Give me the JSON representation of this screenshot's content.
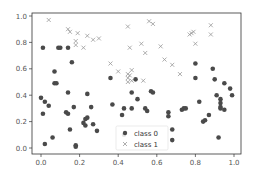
{
  "chart_data": {
    "type": "scatter",
    "title": "",
    "xlabel": "",
    "ylabel": "",
    "xlim": [
      -0.05,
      1.04
    ],
    "ylim": [
      -0.05,
      1.03
    ],
    "grid": false,
    "legend_position": "lower center",
    "x_ticks": [
      "0.0",
      "0.2",
      "0.4",
      "0.6",
      "0.8",
      "1.0"
    ],
    "y_ticks": [
      "0.0",
      "0.2",
      "0.4",
      "0.6",
      "0.8",
      "1.0"
    ],
    "series": [
      {
        "name": "class 0",
        "marker": "circle",
        "color": "#4a4a4a",
        "points": [
          [
            0.01,
            0.76
          ],
          [
            0.09,
            0.76
          ],
          [
            0.1,
            0.76
          ],
          [
            0.14,
            0.76
          ],
          [
            0.16,
            0.65
          ],
          [
            0.07,
            0.58
          ],
          [
            0.07,
            0.49
          ],
          [
            0.08,
            0.49
          ],
          [
            0.14,
            0.42
          ],
          [
            0.24,
            0.41
          ],
          [
            0.0,
            0.38
          ],
          [
            0.02,
            0.35
          ],
          [
            0.04,
            0.32
          ],
          [
            0.01,
            0.26
          ],
          [
            0.13,
            0.27
          ],
          [
            0.14,
            0.26
          ],
          [
            0.17,
            0.31
          ],
          [
            0.26,
            0.31
          ],
          [
            0.37,
            0.33
          ],
          [
            0.43,
            0.3
          ],
          [
            0.23,
            0.22
          ],
          [
            0.24,
            0.23
          ],
          [
            0.22,
            0.19
          ],
          [
            0.23,
            0.17
          ],
          [
            0.27,
            0.18
          ],
          [
            0.15,
            0.14
          ],
          [
            0.29,
            0.13
          ],
          [
            0.06,
            0.08
          ],
          [
            0.02,
            0.03
          ],
          [
            0.18,
            0.02
          ],
          [
            0.18,
            0.01
          ],
          [
            0.43,
            0.1
          ],
          [
            0.49,
            0.52
          ],
          [
            0.36,
            0.53
          ],
          [
            0.47,
            0.42
          ],
          [
            0.5,
            0.37
          ],
          [
            0.57,
            0.43
          ],
          [
            0.58,
            0.42
          ],
          [
            0.54,
            0.3
          ],
          [
            0.55,
            0.28
          ],
          [
            0.47,
            0.3
          ],
          [
            0.42,
            0.25
          ],
          [
            0.66,
            0.27
          ],
          [
            0.66,
            0.24
          ],
          [
            0.73,
            0.29
          ],
          [
            0.74,
            0.3
          ],
          [
            0.75,
            0.3
          ],
          [
            0.68,
            0.14
          ],
          [
            0.68,
            0.06
          ],
          [
            0.8,
            0.53
          ],
          [
            0.82,
            0.35
          ],
          [
            0.84,
            0.2
          ],
          [
            0.85,
            0.21
          ],
          [
            0.89,
            0.6
          ],
          [
            0.9,
            0.52
          ],
          [
            0.91,
            0.4
          ],
          [
            0.93,
            0.37
          ],
          [
            0.93,
            0.34
          ],
          [
            0.93,
            0.31
          ],
          [
            0.95,
            0.29
          ],
          [
            0.95,
            0.49
          ],
          [
            0.98,
            0.45
          ],
          [
            0.99,
            0.4
          ],
          [
            0.92,
            0.08
          ],
          [
            0.87,
            0.25
          ],
          [
            0.93,
            0.3
          ],
          [
            0.8,
            0.64
          ]
        ]
      },
      {
        "name": "class 1",
        "marker": "x",
        "color": "#999999",
        "points": [
          [
            0.04,
            0.97
          ],
          [
            0.14,
            0.9
          ],
          [
            0.15,
            0.88
          ],
          [
            0.19,
            0.87
          ],
          [
            0.24,
            0.85
          ],
          [
            0.18,
            0.81
          ],
          [
            0.18,
            0.78
          ],
          [
            0.22,
            0.76
          ],
          [
            0.27,
            0.82
          ],
          [
            0.3,
            0.83
          ],
          [
            0.36,
            0.64
          ],
          [
            0.4,
            0.58
          ],
          [
            0.45,
            0.56
          ],
          [
            0.45,
            0.53
          ],
          [
            0.47,
            0.59
          ],
          [
            0.46,
            0.55
          ],
          [
            0.45,
            0.5
          ],
          [
            0.47,
            0.51
          ],
          [
            0.45,
            0.92
          ],
          [
            0.46,
            0.76
          ],
          [
            0.52,
            0.79
          ],
          [
            0.54,
            0.72
          ],
          [
            0.56,
            0.96
          ],
          [
            0.58,
            0.94
          ],
          [
            0.62,
            0.77
          ],
          [
            0.64,
            0.67
          ],
          [
            0.68,
            0.63
          ],
          [
            0.72,
            0.56
          ],
          [
            0.77,
            0.86
          ],
          [
            0.78,
            0.87
          ],
          [
            0.79,
            0.88
          ],
          [
            0.8,
            0.79
          ],
          [
            0.88,
            0.93
          ],
          [
            0.88,
            0.86
          ],
          [
            0.53,
            0.51
          ]
        ]
      }
    ]
  },
  "legend": {
    "items": [
      {
        "label": "class 0",
        "marker": "circle"
      },
      {
        "label": "class 1",
        "marker": "x"
      }
    ]
  },
  "axes": {
    "x_tick_labels": [
      "0.0",
      "0.2",
      "0.4",
      "0.6",
      "0.8",
      "1.0"
    ],
    "y_tick_labels": [
      "0.0",
      "0.2",
      "0.4",
      "0.6",
      "0.8",
      "1.0"
    ]
  }
}
